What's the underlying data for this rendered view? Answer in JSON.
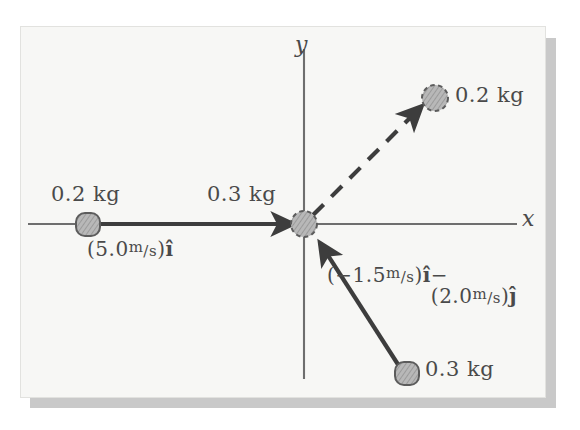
{
  "figure": {
    "panel_background": "#f7f7f5",
    "ink_color": "#4a4a4a",
    "shadow_color": "#c9c9c9"
  },
  "axes": {
    "x_label": "x",
    "y_label": "y",
    "x_axis_color": "#6e6e6e",
    "y_axis_color": "#6e6e6e"
  },
  "masses": [
    {
      "id": "incoming-left",
      "label": "0.2 kg",
      "outline": "solid",
      "x": 86,
      "y": 224
    },
    {
      "id": "target-origin",
      "label": "0.3 kg",
      "outline": "dashed",
      "x": 303,
      "y": 223
    },
    {
      "id": "outgoing-upper-right",
      "label": "0.2 kg",
      "outline": "dashed",
      "x": 436,
      "y": 96
    },
    {
      "id": "incoming-lower-right",
      "label": "0.3 kg",
      "outline": "solid",
      "x": 406,
      "y": 372
    }
  ],
  "vectors": [
    {
      "id": "v-incoming-left",
      "style": "solid",
      "magnitude": "5.0",
      "unit_num": "m",
      "unit_den": "/s",
      "component": "i",
      "label_line1_prefix": "(",
      "label_line1_suffix": ")",
      "label_text": "(5.0 m/s)î"
    },
    {
      "id": "v-outgoing-upper-right",
      "style": "dashed",
      "label_text": ""
    },
    {
      "id": "v-incoming-lower-right",
      "style": "solid",
      "line1": "(−1.5 m/s)î −",
      "line2": "(2.0 m/s)ĵ",
      "mag_x": "−1.5",
      "mag_y": "2.0",
      "unit_num": "m",
      "unit_den": "/s"
    }
  ],
  "labels": {
    "mass_left": "0.2 kg",
    "mass_center": "0.3 kg",
    "mass_upper_right": "0.2 kg",
    "mass_lower_right": "0.3 kg",
    "vec_left_open": "(",
    "vec_left_mag": "5.0",
    "vec_left_unit_num": "m",
    "vec_left_unit_den": "/s",
    "vec_left_close": ")",
    "vec_left_hat": "î",
    "vec_lr_open1": "(",
    "vec_lr_mag1": "−1.5",
    "vec_lr_unit_num1": "m",
    "vec_lr_unit_den1": "/s",
    "vec_lr_close1": ")",
    "vec_lr_hat1": "î",
    "vec_lr_minus": "−",
    "vec_lr_open2": "(",
    "vec_lr_mag2": "2.0",
    "vec_lr_unit_num2": "m",
    "vec_lr_unit_den2": "/s",
    "vec_lr_close2": ")",
    "vec_lr_hat2": "ĵ",
    "axis_x": "x",
    "axis_y": "y"
  }
}
